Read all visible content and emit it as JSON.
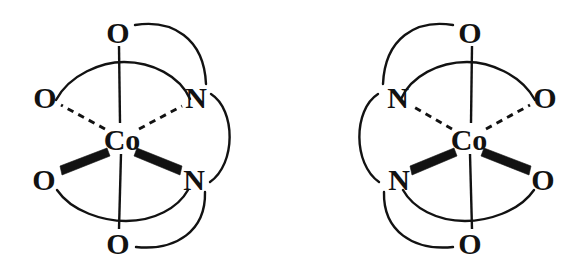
{
  "figure": {
    "background_color": "#ffffff",
    "ink_color": "#121212",
    "width": 582,
    "height": 272,
    "structures": [
      {
        "id": "left",
        "name": "lambda-enantiomer",
        "metal": {
          "label": "Co",
          "x": 122,
          "y": 139
        },
        "ligand_atoms": [
          {
            "id": "l-o-top",
            "label": "O",
            "x": 118,
            "y": 32,
            "bond": "plain",
            "position": "axial-top"
          },
          {
            "id": "l-o-upper",
            "label": "O",
            "x": 45,
            "y": 97,
            "bond": "dashed",
            "position": "equatorial-back-left"
          },
          {
            "id": "l-n-upper",
            "label": "N",
            "x": 196,
            "y": 97,
            "bond": "dashed",
            "position": "equatorial-back-right"
          },
          {
            "id": "l-o-lower",
            "label": "O",
            "x": 44,
            "y": 179,
            "bond": "wedge",
            "position": "equatorial-front-left"
          },
          {
            "id": "l-n-lower",
            "label": "N",
            "x": 194,
            "y": 179,
            "bond": "wedge",
            "position": "equatorial-front-right"
          },
          {
            "id": "l-o-bot",
            "label": "O",
            "x": 118,
            "y": 243,
            "bond": "plain",
            "position": "axial-bottom"
          }
        ],
        "chelate_bridges": [
          {
            "from": "l-o-top",
            "to": "l-n-upper",
            "side": "right"
          },
          {
            "from": "l-n-upper",
            "to": "l-n-lower",
            "side": "right"
          },
          {
            "from": "l-n-lower",
            "to": "l-o-bot",
            "side": "right"
          }
        ]
      },
      {
        "id": "right",
        "name": "delta-enantiomer",
        "metal": {
          "label": "Co",
          "x": 469,
          "y": 139
        },
        "ligand_atoms": [
          {
            "id": "r-o-top",
            "label": "O",
            "x": 470,
            "y": 32,
            "bond": "plain",
            "position": "axial-top"
          },
          {
            "id": "r-n-upper",
            "label": "N",
            "x": 398,
            "y": 97,
            "bond": "dashed",
            "position": "equatorial-back-left"
          },
          {
            "id": "r-o-upper",
            "label": "O",
            "x": 545,
            "y": 97,
            "bond": "dashed",
            "position": "equatorial-back-right"
          },
          {
            "id": "r-n-lower",
            "label": "N",
            "x": 399,
            "y": 179,
            "bond": "wedge",
            "position": "equatorial-front-left"
          },
          {
            "id": "r-o-lower",
            "label": "O",
            "x": 543,
            "y": 179,
            "bond": "wedge",
            "position": "equatorial-front-right"
          },
          {
            "id": "r-o-bot",
            "label": "O",
            "x": 470,
            "y": 243,
            "bond": "plain",
            "position": "axial-bottom"
          }
        ],
        "chelate_bridges": [
          {
            "from": "r-o-top",
            "to": "r-n-upper",
            "side": "left"
          },
          {
            "from": "r-n-upper",
            "to": "r-n-lower",
            "side": "left"
          },
          {
            "from": "r-n-lower",
            "to": "r-o-bot",
            "side": "left"
          }
        ]
      }
    ],
    "legend": {
      "oxygen": "O",
      "nitrogen": "N",
      "cobalt": "Co"
    }
  }
}
